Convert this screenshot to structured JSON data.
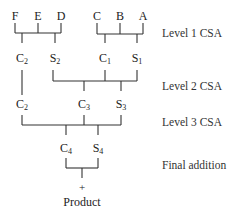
{
  "diagram": {
    "type": "carry-save-adder-tree",
    "inputs": [
      {
        "label": "F",
        "x": 15,
        "y": 10
      },
      {
        "label": "E",
        "x": 38,
        "y": 10
      },
      {
        "label": "D",
        "x": 61,
        "y": 10
      },
      {
        "label": "C",
        "x": 97,
        "y": 10
      },
      {
        "label": "B",
        "x": 120,
        "y": 10
      },
      {
        "label": "A",
        "x": 143,
        "y": 10
      }
    ],
    "level1_outputs": [
      {
        "base": "C",
        "sub": "2",
        "x": 22,
        "y": 52
      },
      {
        "base": "S",
        "sub": "2",
        "x": 55,
        "y": 52
      },
      {
        "base": "C",
        "sub": "1",
        "x": 105,
        "y": 52
      },
      {
        "base": "S",
        "sub": "1",
        "x": 137,
        "y": 52
      }
    ],
    "level2_outputs": [
      {
        "base": "C",
        "sub": "2",
        "x": 22,
        "y": 98
      },
      {
        "base": "C",
        "sub": "3",
        "x": 84,
        "y": 98
      },
      {
        "base": "S",
        "sub": "3",
        "x": 121,
        "y": 98
      }
    ],
    "level3_outputs": [
      {
        "base": "C",
        "sub": "4",
        "x": 66,
        "y": 142
      },
      {
        "base": "S",
        "sub": "4",
        "x": 98,
        "y": 142
      }
    ],
    "final_operator": {
      "symbol": "+",
      "x": 82,
      "y": 182
    },
    "result": {
      "label": "Product",
      "x": 82,
      "y": 196
    },
    "level_labels": [
      {
        "text": "Level 1 CSA",
        "x": 162,
        "y": 27
      },
      {
        "text": "Level 2 CSA",
        "x": 162,
        "y": 80
      },
      {
        "text": "Level 3 CSA",
        "x": 162,
        "y": 116
      },
      {
        "text": "Final addition",
        "x": 162,
        "y": 159
      }
    ],
    "line_color": "#333333",
    "text_color": "#222222"
  }
}
